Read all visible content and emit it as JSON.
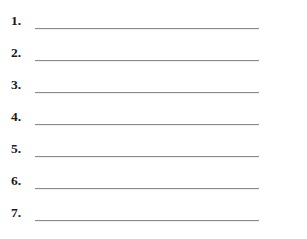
{
  "page": {
    "type": "numbered-blank-list",
    "background_color": "#ffffff",
    "width": 307,
    "height": 239,
    "title": "",
    "rule_color": "#8c8c8c",
    "number_color": "#1a1a1a"
  },
  "list": {
    "count": 7,
    "items": [
      {
        "number": "1.",
        "value": "",
        "placeholder": ""
      },
      {
        "number": "2.",
        "value": "",
        "placeholder": ""
      },
      {
        "number": "3.",
        "value": "",
        "placeholder": ""
      },
      {
        "number": "4.",
        "value": "",
        "placeholder": ""
      },
      {
        "number": "5.",
        "value": "",
        "placeholder": ""
      },
      {
        "number": "6.",
        "value": "",
        "placeholder": ""
      },
      {
        "number": "7.",
        "value": "",
        "placeholder": ""
      }
    ]
  }
}
